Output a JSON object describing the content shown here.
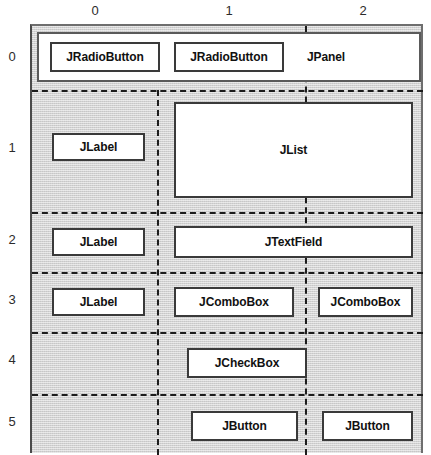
{
  "diagram": {
    "columns": [
      {
        "label": "0",
        "center_x": 95
      },
      {
        "label": "1",
        "center_x": 229
      },
      {
        "label": "2",
        "center_x": 363
      }
    ],
    "rows": [
      {
        "label": "0",
        "center_y": 57
      },
      {
        "label": "1",
        "center_y": 148
      },
      {
        "label": "2",
        "center_y": 240
      },
      {
        "label": "3",
        "center_y": 300
      },
      {
        "label": "4",
        "center_y": 360
      },
      {
        "label": "5",
        "center_y": 422
      }
    ],
    "components": [
      {
        "name": "jpanel",
        "label": "JPanel",
        "row": 0,
        "col_start": 0,
        "col_end": 2
      },
      {
        "name": "jradiobutton1",
        "label": "JRadioButton",
        "row": 0,
        "col_start": 0,
        "col_end": 0
      },
      {
        "name": "jradiobutton2",
        "label": "JRadioButton",
        "row": 0,
        "col_start": 1,
        "col_end": 1
      },
      {
        "name": "jlabel1",
        "label": "JLabel",
        "row": 1,
        "col_start": 0,
        "col_end": 0
      },
      {
        "name": "jlist",
        "label": "JList",
        "row": 1,
        "col_start": 1,
        "col_end": 2
      },
      {
        "name": "jlabel2",
        "label": "JLabel",
        "row": 2,
        "col_start": 0,
        "col_end": 0
      },
      {
        "name": "jtextfield",
        "label": "JTextField",
        "row": 2,
        "col_start": 1,
        "col_end": 2
      },
      {
        "name": "jlabel3",
        "label": "JLabel",
        "row": 3,
        "col_start": 0,
        "col_end": 0
      },
      {
        "name": "jcombobox1",
        "label": "JComboBox",
        "row": 3,
        "col_start": 1,
        "col_end": 1
      },
      {
        "name": "jcombobox2",
        "label": "JComboBox",
        "row": 3,
        "col_start": 2,
        "col_end": 2
      },
      {
        "name": "jcheckbox",
        "label": "JCheckBox",
        "row": 4,
        "col_start": 1,
        "col_end": 1
      },
      {
        "name": "jbutton1",
        "label": "JButton",
        "row": 5,
        "col_start": 1,
        "col_end": 1
      },
      {
        "name": "jbutton2",
        "label": "JButton",
        "row": 5,
        "col_start": 2,
        "col_end": 2
      }
    ],
    "colors": {
      "grid_background": "#d2d2d2",
      "component_fill": "#ffffff",
      "component_border": "#3a3a3a",
      "separator": "#1c1c1c",
      "text": "#111111"
    }
  }
}
